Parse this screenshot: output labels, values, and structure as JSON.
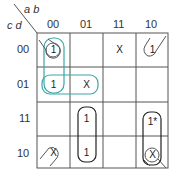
{
  "kmap": {
    "row_var_label": "c d",
    "col_var_label": "a b",
    "col_headers": [
      "00",
      "01",
      "11",
      "10"
    ],
    "row_headers": [
      "00",
      "01",
      "11",
      "10"
    ],
    "cells": [
      [
        "1",
        "",
        "X",
        "1"
      ],
      [
        "1",
        "X",
        "",
        ""
      ],
      [
        "",
        "1",
        "",
        "1*"
      ],
      [
        "X",
        "1",
        "",
        "X"
      ]
    ],
    "groups": [
      {
        "name": "col00-rows00-01",
        "color": "#3aa6a6",
        "cells": [
          [
            0,
            0
          ],
          [
            1,
            0
          ]
        ]
      },
      {
        "name": "row01-cols00-01",
        "color": "#3aa6a6",
        "cells": [
          [
            1,
            0
          ],
          [
            1,
            1
          ]
        ]
      },
      {
        "name": "col01-rows11-10",
        "color": "#222222",
        "cells": [
          [
            2,
            1
          ],
          [
            3,
            1
          ]
        ]
      },
      {
        "name": "col10-rows11-10",
        "color": "#222222",
        "cells": [
          [
            2,
            3
          ],
          [
            3,
            3
          ]
        ]
      },
      {
        "name": "four-corners",
        "color": "#555555",
        "cells": [
          [
            0,
            0
          ],
          [
            0,
            3
          ],
          [
            3,
            0
          ],
          [
            3,
            3
          ]
        ]
      }
    ],
    "colors": {
      "grid": "#555555",
      "teal_group": "#3aa6a6",
      "black_group": "#222222",
      "text": "#333333"
    }
  }
}
